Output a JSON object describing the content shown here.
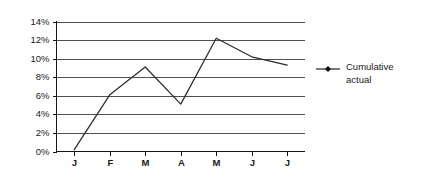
{
  "chart_data": {
    "type": "line",
    "title": "",
    "xlabel": "",
    "ylabel": "",
    "categories": [
      "J",
      "F",
      "M",
      "A",
      "M",
      "J",
      "J"
    ],
    "series": [
      {
        "name": "Cumulative actual",
        "values": [
          0.2,
          6.1,
          9.1,
          5.1,
          12.2,
          10.2,
          9.3
        ],
        "color": "#2b2b2b",
        "marker": "diamond"
      }
    ],
    "ylim": [
      0,
      14
    ],
    "ytick_values": [
      0,
      2,
      4,
      6,
      8,
      10,
      12,
      14
    ],
    "ytick_labels": [
      "0%",
      "2%",
      "4%",
      "6%",
      "8%",
      "10%",
      "12%",
      "14%"
    ],
    "grid": true,
    "grid_axis": "y",
    "legend_position": "right",
    "legend_entries": [
      "Cumulative actual"
    ],
    "background": "#ffffff"
  },
  "legend": {
    "entry_line_1": "Cumulative",
    "entry_line_2": "actual"
  }
}
